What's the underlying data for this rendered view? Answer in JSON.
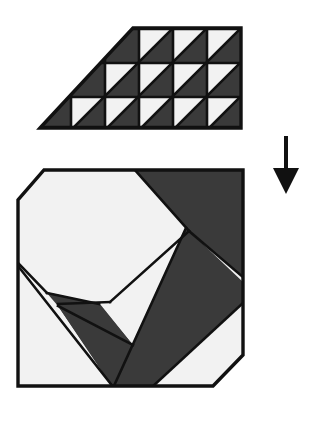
{
  "figure": {
    "title": "Quilt block piecing diagram",
    "background_color": "#ffffff",
    "dark_color": "#3a3a3a",
    "light_color": "#f2f2f2",
    "outline_color": "#111111",
    "canvas": {
      "width": 312,
      "height": 426
    }
  },
  "top_shape": {
    "name": "pieced half-square-triangle trapezoid",
    "description": "Trapezoid grid of half-square-triangle units, white triangle upper-left and dark triangle lower-right in each unit",
    "rows": 3,
    "columns_per_row": [
      3,
      4,
      5
    ],
    "unit_pattern": "white-upper-left-dark-lower-right",
    "outline": "40,128 133,28 241,28 241,128",
    "cell_size": 34,
    "grid_origin": {
      "x": 37,
      "y": 28
    },
    "cells": [
      {
        "row": 0,
        "col": 2,
        "x": 139,
        "y": 30,
        "light": "upper-left",
        "dark": "lower-right"
      },
      {
        "row": 0,
        "col": 3,
        "x": 173,
        "y": 30,
        "light": "upper-left",
        "dark": "lower-right"
      },
      {
        "row": 0,
        "col": 4,
        "x": 207,
        "y": 30,
        "light": "upper-left",
        "dark": "lower-right"
      },
      {
        "row": 1,
        "col": 1,
        "x": 105,
        "y": 64,
        "light": "upper-left",
        "dark": "lower-right"
      },
      {
        "row": 1,
        "col": 2,
        "x": 139,
        "y": 64,
        "light": "upper-left",
        "dark": "lower-right"
      },
      {
        "row": 1,
        "col": 3,
        "x": 173,
        "y": 64,
        "light": "upper-left",
        "dark": "lower-right"
      },
      {
        "row": 1,
        "col": 4,
        "x": 207,
        "y": 64,
        "light": "upper-left",
        "dark": "lower-right"
      },
      {
        "row": 2,
        "col": 0,
        "x": 71,
        "y": 98,
        "light": "upper-left",
        "dark": "lower-right"
      },
      {
        "row": 2,
        "col": 1,
        "x": 105,
        "y": 98,
        "light": "upper-left",
        "dark": "lower-right"
      },
      {
        "row": 2,
        "col": 2,
        "x": 139,
        "y": 98,
        "light": "upper-left",
        "dark": "lower-right"
      },
      {
        "row": 2,
        "col": 3,
        "x": 173,
        "y": 98,
        "light": "upper-left",
        "dark": "lower-right"
      },
      {
        "row": 2,
        "col": 4,
        "x": 207,
        "y": 98,
        "light": "upper-left",
        "dark": "lower-right"
      }
    ]
  },
  "bottom_shape": {
    "name": "assembled octagonal block",
    "description": "Square block with top-left and bottom-right corners trimmed, containing a dark diagonal sash band and dark corner triangle",
    "outline": "44,170 243,170 243,355 213,386 18,386 18,200",
    "dark_regions": [
      {
        "name": "top-right-dark-triangle",
        "points": "134,170 243,170 243,275 190,232"
      },
      {
        "name": "diagonal-sash-band",
        "points": "185,228 243,282 243,300 150,386 115,386 60,305 98,305 132,345"
      },
      {
        "name": "lower-left-dark-wedge",
        "points": "47,293 99,304 132,345 112,386"
      }
    ],
    "light_regions": [
      {
        "name": "upper-left-light-field",
        "points": "44,170 134,170 190,232 110,302 47,293 18,262 18,200"
      },
      {
        "name": "lower-right-light-field",
        "points": "190,232 243,285 243,355 213,386 152,386"
      },
      {
        "name": "lower-left-light-field",
        "points": "18,266 46,294 112,386 18,386"
      }
    ]
  },
  "arrow": {
    "name": "downward-process-arrow",
    "direction": "down",
    "x": 286,
    "tail_top_y": 136,
    "tail_bottom_y": 172,
    "head_tip_y": 194,
    "head_half_width": 13,
    "stroke_width": 4
  }
}
